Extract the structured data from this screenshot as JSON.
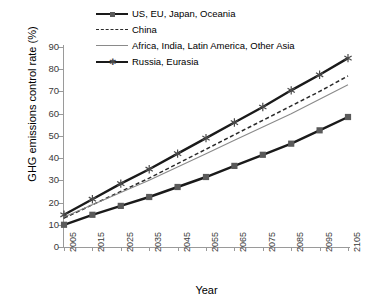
{
  "chart_data": {
    "type": "line",
    "title": "",
    "xlabel": "Year",
    "ylabel": "GHG emissions control rate (%)",
    "x": [
      2005,
      2015,
      2025,
      2035,
      2045,
      2055,
      2065,
      2075,
      2085,
      2095,
      2105
    ],
    "xtick_labels": [
      "2005",
      "2015",
      "2025",
      "2035",
      "2045",
      "2055",
      "2065",
      "2075",
      "2085",
      "2095",
      "2105"
    ],
    "ytick_labels": [
      "0",
      "10",
      "20",
      "30",
      "40",
      "50",
      "60",
      "70",
      "80",
      "90"
    ],
    "yticks": [
      0,
      10,
      20,
      30,
      40,
      50,
      60,
      70,
      80,
      90
    ],
    "ylim": [
      0,
      90
    ],
    "xlim": [
      2005,
      2105
    ],
    "grid": false,
    "legend_position": "top-center",
    "series": [
      {
        "name": "US, EU, Japan, Oceania",
        "values": [
          10.0,
          14.5,
          18.5,
          22.5,
          27.0,
          31.5,
          36.5,
          41.5,
          46.5,
          52.5,
          58.5
        ],
        "color": "#1a1a1a",
        "style": "solid-thick-square"
      },
      {
        "name": "China",
        "values": [
          13.0,
          19.0,
          25.0,
          31.0,
          37.5,
          44.0,
          50.5,
          57.0,
          63.5,
          70.0,
          77.0
        ],
        "color": "#2b2b2b",
        "style": "dashed"
      },
      {
        "name": "Africa, India, Latin America, Other Asia",
        "values": [
          13.5,
          19.0,
          24.5,
          30.0,
          36.0,
          42.0,
          48.0,
          54.0,
          60.0,
          66.5,
          73.0
        ],
        "color": "#8a8a8a",
        "style": "solid-thin"
      },
      {
        "name": "Russia, Eurasia",
        "values": [
          14.5,
          21.5,
          28.5,
          35.0,
          42.0,
          49.0,
          56.0,
          63.0,
          70.5,
          77.5,
          85.0
        ],
        "color": "#1a1a1a",
        "style": "solid-thick-star"
      }
    ]
  },
  "legend": {
    "entries": [
      {
        "label": "US, EU, Japan, Oceania",
        "marker": "square-marker-icon"
      },
      {
        "label": "China",
        "marker": "dashed-line-icon"
      },
      {
        "label": "Africa, India, Latin America, Other Asia",
        "marker": "thin-line-icon"
      },
      {
        "label": "Russia, Eurasia",
        "marker": "star-marker-icon"
      }
    ]
  },
  "axes": {
    "y_title": "GHG emissions control rate (%)",
    "x_title": "Year"
  },
  "colors": {
    "series_dark": "#1a1a1a",
    "series_dash": "#2b2b2b",
    "series_gray": "#8a8a8a",
    "marker_fill": "#5a5a5a",
    "axis": "#9a9a9a",
    "background": "#ffffff"
  }
}
